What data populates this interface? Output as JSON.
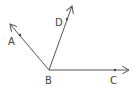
{
  "diagram": {
    "type": "geometry-rays",
    "vertex": {
      "label": "B"
    },
    "rays": [
      {
        "name": "BA",
        "point_label": "A"
      },
      {
        "name": "BD",
        "point_label": "D"
      },
      {
        "name": "BC",
        "point_label": "C"
      }
    ],
    "stroke_color": "#555555"
  }
}
